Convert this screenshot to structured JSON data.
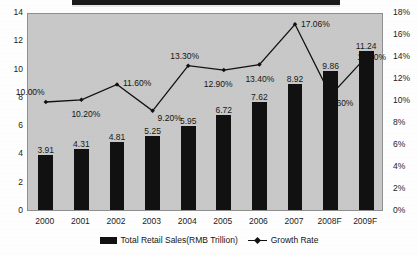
{
  "chart_data": {
    "type": "bar",
    "title": "",
    "xlabel": "",
    "ylabel": "",
    "categories": [
      "2000",
      "2001",
      "2002",
      "2003",
      "2004",
      "2005",
      "2006",
      "2007",
      "2008F",
      "2009F"
    ],
    "grid": false,
    "legend_position": "bottom",
    "left_axis": {
      "label": "",
      "ylim": [
        0,
        14
      ],
      "ticks": [
        "0",
        "2",
        "4",
        "6",
        "8",
        "10",
        "12",
        "14"
      ],
      "tick_values": [
        0,
        2,
        4,
        6,
        8,
        10,
        12,
        14
      ]
    },
    "right_axis": {
      "label": "",
      "ylim": [
        0,
        18
      ],
      "ticks": [
        "0%",
        "2%",
        "4%",
        "6%",
        "8%",
        "10%",
        "12%",
        "14%",
        "16%",
        "18%"
      ],
      "tick_values": [
        0,
        2,
        4,
        6,
        8,
        10,
        12,
        14,
        16,
        18
      ]
    },
    "series": [
      {
        "name": "Total Retail Sales(RMB Trillion)",
        "type": "bar",
        "axis": "left",
        "color": "#111111",
        "values": [
          3.91,
          4.31,
          4.81,
          5.25,
          5.95,
          6.72,
          7.62,
          8.92,
          9.86,
          11.24
        ],
        "data_labels": [
          "3.91",
          "4.31",
          "4.81",
          "5.25",
          "5.95",
          "6.72",
          "7.62",
          "8.92",
          "9.86",
          "11.24"
        ]
      },
      {
        "name": "Growth Rate",
        "type": "line",
        "axis": "right",
        "color": "#111111",
        "marker": "diamond",
        "values": [
          10.0,
          10.2,
          11.6,
          9.2,
          13.3,
          12.9,
          13.4,
          17.06,
          10.6,
          14.1
        ],
        "data_labels": [
          "10.00%",
          "10.20%",
          "11.60%",
          "9.20%",
          "13.30%",
          "12.90%",
          "13.40%",
          "17.06%",
          "10.60%",
          "14.10%"
        ]
      }
    ]
  },
  "legend": {
    "bar_label": "Total Retail Sales(RMB Trillion)",
    "line_label": "Growth Rate"
  },
  "colors": {
    "bar": "#111111",
    "line": "#111111",
    "plot_background": "#c9c9c9",
    "page_background": "#ffffff"
  }
}
